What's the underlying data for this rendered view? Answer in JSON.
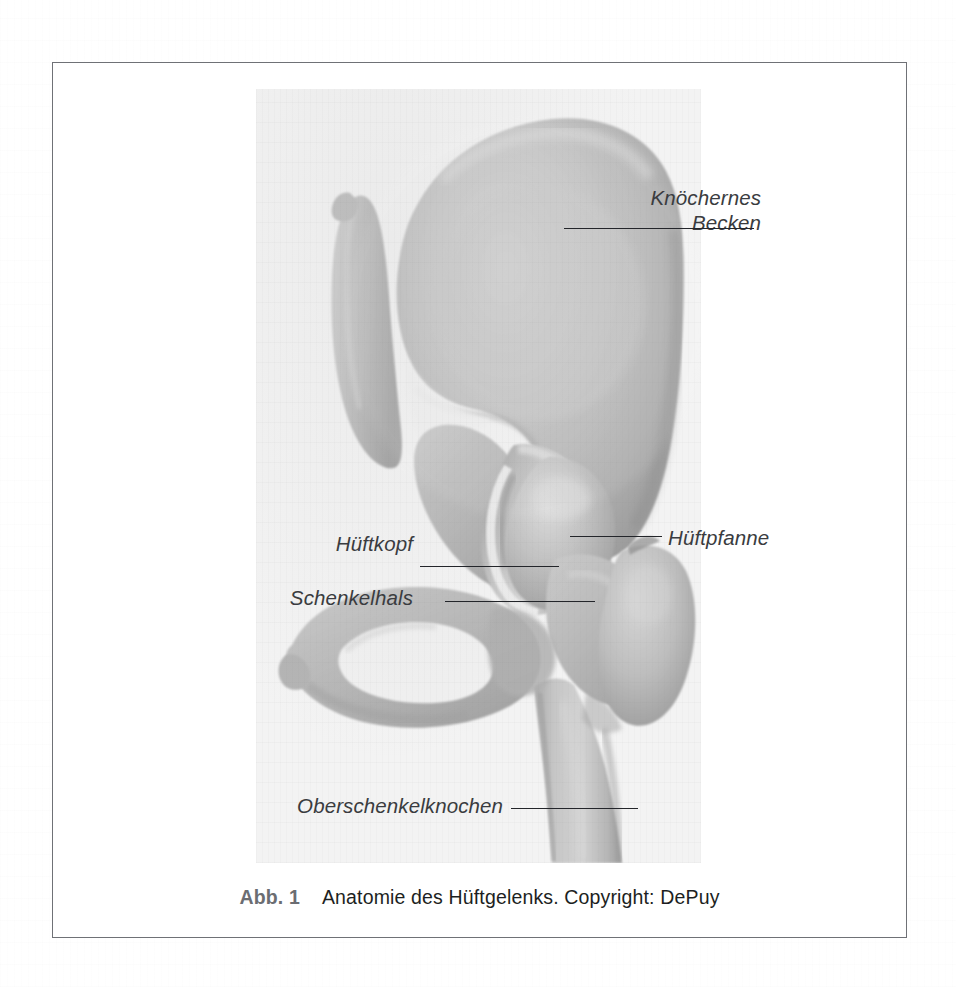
{
  "figure": {
    "caption_number": "Abb. 1",
    "caption_text": "Anatomie des Hüftgelenks. Copyright: DePuy",
    "frame_border_color": "#6f7176",
    "plate_background": "#f3f3f3",
    "bone_midtone": "#b7b7b7",
    "label_color": "#3a3c40",
    "leader_color": "#23252a"
  },
  "labels": [
    {
      "id": "knoechernes-becken",
      "text_line1": "Knöchernes",
      "text_line2": "Becken",
      "full": "Knöchernes Becken",
      "side": "right",
      "anatomy": "bony pelvis"
    },
    {
      "id": "hueftpfanne",
      "text": "Hüftpfanne",
      "side": "right",
      "anatomy": "acetabulum"
    },
    {
      "id": "hueftkopf",
      "text": "Hüftkopf",
      "side": "left",
      "anatomy": "femoral head"
    },
    {
      "id": "schenkelhals",
      "text": "Schenkelhals",
      "side": "left",
      "anatomy": "femoral neck"
    },
    {
      "id": "oberschenkelknochen",
      "text": "Oberschenkelknochen",
      "side": "left",
      "anatomy": "femur"
    }
  ]
}
